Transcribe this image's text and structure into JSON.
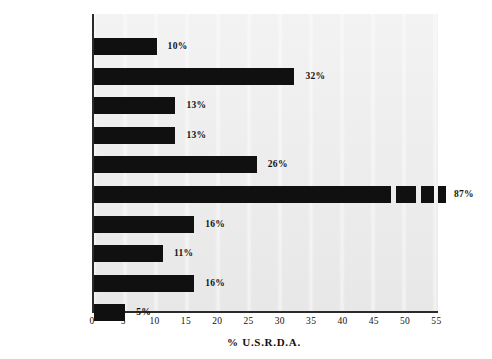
{
  "chart_data": {
    "type": "bar",
    "orientation": "horizontal",
    "title": "",
    "xlabel": "% U.S.R.D.A.",
    "ylabel": "",
    "xlim": [
      0,
      55
    ],
    "xticks": [
      0,
      5,
      10,
      15,
      20,
      25,
      30,
      35,
      40,
      45,
      50,
      55
    ],
    "grid": false,
    "legend": null,
    "bar_color": "#101010",
    "plot_background": "#ececec",
    "axis_color": "#2b2b2b",
    "note": "Vitamin A bar is broken into segments and extends beyond the 55 axis limit; its true value is 87%.",
    "categories": [
      "CALORIES",
      "PROTEIN",
      "IRON",
      "ZINC",
      "CALCIUM",
      "VITAMIN A",
      "VITAMIN C",
      "THIAMIN",
      "RIBOFLAVIN",
      "NIACIN"
    ],
    "values": [
      10,
      32,
      13,
      13,
      26,
      87,
      16,
      11,
      16,
      5
    ],
    "value_labels": [
      "10%",
      "32%",
      "13%",
      "13%",
      "26%",
      "87%",
      "16%",
      "11%",
      "16%",
      "5%"
    ],
    "bars": [
      {
        "label": "CALORIES",
        "value": 10,
        "value_label": "10%",
        "drawn_length": 10
      },
      {
        "label": "PROTEIN",
        "value": 32,
        "value_label": "32%",
        "drawn_length": 32
      },
      {
        "label": "IRON",
        "value": 13,
        "value_label": "13%",
        "drawn_length": 13
      },
      {
        "label": "ZINC",
        "value": 13,
        "value_label": "13%",
        "drawn_length": 13
      },
      {
        "label": "CALCIUM",
        "value": 26,
        "value_label": "26%",
        "drawn_length": 26
      },
      {
        "label": "VITAMIN A",
        "value": 87,
        "value_label": "87%",
        "drawn_length": 55,
        "broken": true
      },
      {
        "label": "VITAMIN C",
        "value": 16,
        "value_label": "16%",
        "drawn_length": 16
      },
      {
        "label": "THIAMIN",
        "value": 11,
        "value_label": "11%",
        "drawn_length": 11
      },
      {
        "label": "RIBOFLAVIN",
        "value": 16,
        "value_label": "16%",
        "drawn_length": 16
      },
      {
        "label": "NIACIN",
        "value": 5,
        "value_label": "5%",
        "drawn_length": 5
      }
    ]
  }
}
